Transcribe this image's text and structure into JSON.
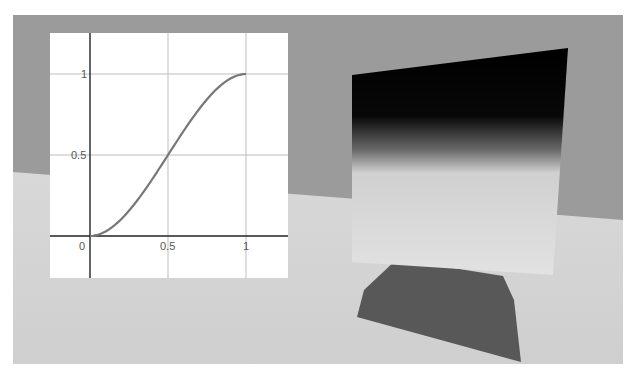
{
  "scene": {
    "description": "3D render: gradient panel standing on a floor casting a shadow",
    "colors": {
      "wall": "#9a9a9a",
      "floor": "#d2d2d2",
      "panel_top": "#000000",
      "panel_bottom": "#dedede",
      "shadow": "#585858"
    }
  },
  "chart_data": {
    "type": "line",
    "title": "",
    "xlabel": "",
    "ylabel": "",
    "function": "smoothstep: y = 3x^2 - 2x^3",
    "x": [
      0,
      0.1,
      0.2,
      0.3,
      0.4,
      0.5,
      0.6,
      0.7,
      0.8,
      0.9,
      1.0
    ],
    "values": [
      0,
      0.028,
      0.104,
      0.216,
      0.352,
      0.5,
      0.648,
      0.784,
      0.896,
      0.972,
      1.0
    ],
    "x_ticks": [
      "0",
      "0.5",
      "1"
    ],
    "y_ticks": [
      "0.5",
      "1"
    ],
    "xlim": [
      -0.25,
      1.25
    ],
    "ylim": [
      -0.25,
      1.25
    ],
    "grid": true,
    "line_color": "#777777",
    "legend": null
  },
  "labels": {
    "origin": "0",
    "x_half": "0.5",
    "x_one": "1",
    "y_half": "0.5",
    "y_one": "1"
  }
}
